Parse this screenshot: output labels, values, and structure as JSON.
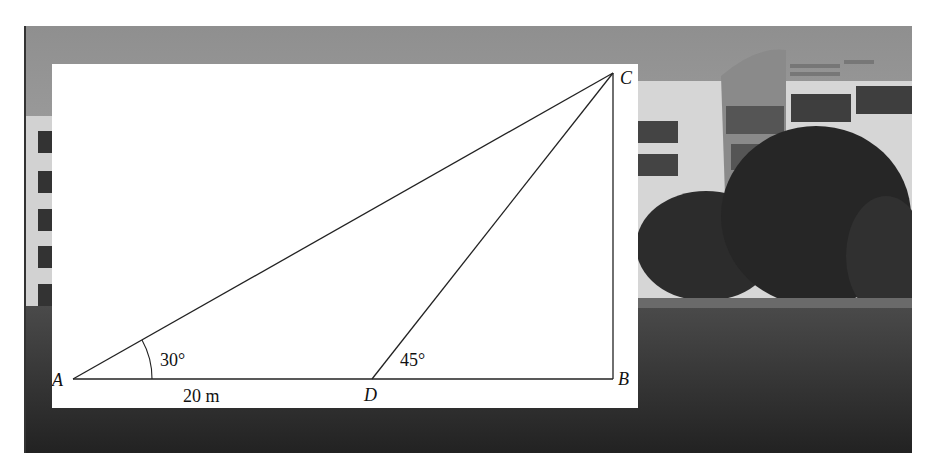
{
  "figure": {
    "type": "right-triangle height measurement diagram over photograph of building",
    "vertices": {
      "A": "A",
      "B": "B",
      "C": "C",
      "D": "D"
    },
    "angles": {
      "at_A": "30°",
      "at_D": "45°"
    },
    "measurements": {
      "AD": "20 m"
    },
    "colors": {
      "lines": "#222222",
      "panel": "#ffffff",
      "photo_dark": "#2a2a2a",
      "photo_sky": "#a9a9a9"
    }
  }
}
